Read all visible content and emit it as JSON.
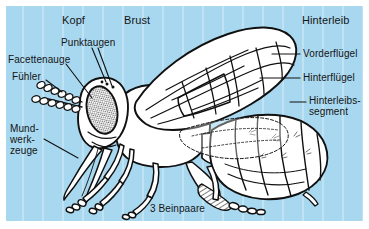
{
  "figure": {
    "background_color": "#a8d8f0",
    "panel_border_color": "#ffffff",
    "ink_color": "#101010"
  },
  "regions": [
    {
      "id": "kopf",
      "label": "Kopf"
    },
    {
      "id": "brust",
      "label": "Brust"
    },
    {
      "id": "hinterleib",
      "label": "Hinterleib"
    }
  ],
  "labels": {
    "punktaugen": "Punktaugen",
    "facettenauge": "Facettenauge",
    "fuehler": "Fühler",
    "mundwerkzeuge": "Mund-\nwerk-\nzeuge",
    "vorderfluegel": "Vorderflügel",
    "hinterfluegel": "Hinterflügel",
    "hinterleibssegment": "Hinterleibs-\nsegment",
    "beinpaare": "3 Beinpaare"
  },
  "parts": {
    "compound_eye": "compound-eye",
    "ocelli": "ocelli",
    "antenna": "antenna",
    "mouthparts": "mouthparts",
    "forewing": "forewing",
    "hindwing": "hindwing",
    "abdomen_segments": "abdomen-segments",
    "legs": "legs",
    "pollen_basket": "pollen-basket",
    "sting": "sting"
  }
}
